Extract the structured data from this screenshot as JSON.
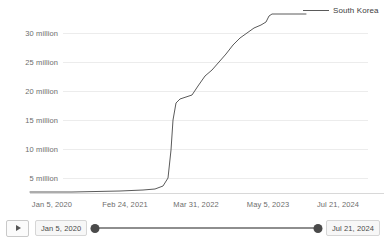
{
  "legend": {
    "label": "South Korea",
    "color": "#5a5a5a"
  },
  "axes": {
    "y_ticks": [
      "5 million",
      "10 million",
      "15 million",
      "20 million",
      "25 million",
      "30 million"
    ],
    "x_ticks": [
      "Jan 5, 2020",
      "Feb 24, 2021",
      "Mar 31, 2022",
      "May 5, 2023",
      "Jul 21, 2024"
    ]
  },
  "timeline": {
    "play_label": "play-button",
    "start_date": "Jan 5, 2020",
    "end_date": "Jul 21, 2024"
  },
  "chart_data": {
    "type": "line",
    "title": "",
    "xlabel": "",
    "ylabel": "",
    "grid": true,
    "legend_position": "right",
    "series": [
      {
        "name": "South Korea",
        "color": "#5a5a5a",
        "x": [
          "Jan 5, 2020",
          "Jun 2020",
          "Dec 2020",
          "Feb 24, 2021",
          "Aug 2021",
          "Dec 2021",
          "Jan 2022",
          "Feb 2022",
          "Mar 10, 2022",
          "Mar 31, 2022",
          "Apr 2022",
          "May 2022",
          "Jul 2022",
          "Sep 2022",
          "Dec 2022",
          "Feb 2023",
          "May 5, 2023",
          "Jul 2023",
          "Sep 2023",
          "Nov 2023",
          "Jan 2024",
          "Mar 2024",
          "Jul 21, 2024"
        ],
        "y": [
          0,
          0.02,
          0.06,
          0.09,
          0.25,
          0.63,
          1.1,
          3.3,
          10.5,
          13.5,
          15.5,
          17.8,
          18.6,
          19.2,
          21.5,
          24.8,
          28.3,
          29.6,
          30.4,
          31.2,
          32.6,
          33.2,
          33.2
        ],
        "unit": "million",
        "points_px": [
          [
            30,
            192
          ],
          [
            48,
            192
          ],
          [
            72,
            192
          ],
          [
            96,
            191.5
          ],
          [
            120,
            191
          ],
          [
            143,
            190
          ],
          [
            155,
            189
          ],
          [
            163,
            186
          ],
          [
            168,
            178
          ],
          [
            171,
            150
          ],
          [
            173,
            120
          ],
          [
            176,
            103
          ],
          [
            180,
            99
          ],
          [
            186,
            97
          ],
          [
            192,
            95
          ],
          [
            198,
            86
          ],
          [
            205,
            76
          ],
          [
            212,
            70
          ],
          [
            219,
            62
          ],
          [
            226,
            54
          ],
          [
            233,
            45
          ],
          [
            240,
            38
          ],
          [
            247,
            33
          ],
          [
            254,
            28
          ],
          [
            261,
            25
          ],
          [
            266,
            22
          ],
          [
            269,
            16
          ],
          [
            272,
            14
          ],
          [
            300,
            14
          ],
          [
            306,
            14
          ]
        ]
      }
    ],
    "ylim": [
      0,
      36
    ],
    "y_tick_values": [
      5,
      10,
      15,
      20,
      25,
      30
    ]
  }
}
